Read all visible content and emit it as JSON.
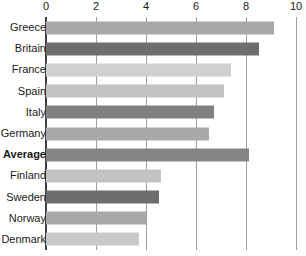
{
  "chart_data": {
    "type": "bar",
    "orientation": "horizontal",
    "title": "",
    "subtitle": "",
    "xlabel": "",
    "ylabel": "",
    "xlim": [
      0,
      10
    ],
    "ylim": null,
    "grid": true,
    "grid_axis": "x",
    "legend": null,
    "legend_position": "none",
    "xticks": [
      0,
      2,
      4,
      6,
      8,
      10
    ],
    "xtick_labels": [
      "0",
      "2",
      "4",
      "6",
      "8",
      "10"
    ],
    "categories": [
      "Greece",
      "Britain",
      "France",
      "Spain",
      "Italy",
      "Germany",
      "Average",
      "Finland",
      "Sweden",
      "Norway",
      "Denmark"
    ],
    "values": [
      9.1,
      8.5,
      7.4,
      7.1,
      6.7,
      6.5,
      8.1,
      4.6,
      4.5,
      4.0,
      3.7
    ],
    "bar_colors": [
      "#a8a8a8",
      "#6e6e6e",
      "#d0d0d0",
      "#c2c2c2",
      "#808080",
      "#a8a8a8",
      "#858585",
      "#c2c2c2",
      "#6e6e6e",
      "#a8a8a8",
      "#c9c9c9"
    ],
    "emphasized_categories": [
      "Average"
    ],
    "annotations": []
  },
  "style": {
    "background": "#ffffff",
    "axis_color": "#3c4043",
    "gridline_color": "#9aa0a6",
    "text_color": "#1a1a1a"
  }
}
